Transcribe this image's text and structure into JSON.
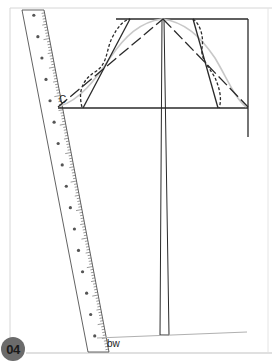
{
  "figure": {
    "step_number": "04",
    "labels": {
      "point_c": "C",
      "point_bw": "bw"
    },
    "ruler": {
      "number_markers": [
        "1",
        "2",
        "3",
        "4",
        "5",
        "6",
        "7",
        "8",
        "9",
        "10",
        "11",
        "12",
        "13",
        "14",
        "15",
        "16"
      ]
    },
    "colors": {
      "line": "#2a2a2a",
      "curve_grey": "#c8c8c8",
      "frame": "#d0d0d0",
      "badge": "#6b6b6b"
    }
  }
}
